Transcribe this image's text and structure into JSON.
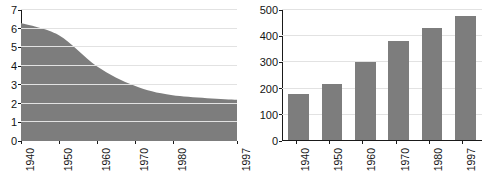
{
  "charts": {
    "left": {
      "title_line1": "NUMBER OF FARMS",
      "title_line2": "(IN MILLIONS)",
      "y_ticks": [
        "0",
        "1",
        "2",
        "3",
        "4",
        "5",
        "6",
        "7"
      ],
      "x_ticks": [
        "1940",
        "1950",
        "1960",
        "1970",
        "1980",
        "1997"
      ]
    },
    "right": {
      "title_line1": "SIZE OF AVERAGE FARM",
      "title_line2": "(IN ACRES)",
      "y_ticks": [
        "0",
        "100",
        "200",
        "300",
        "400",
        "500"
      ],
      "x_ticks": [
        "1940",
        "1950",
        "1960",
        "1970",
        "1980",
        "1997"
      ]
    }
  },
  "chart_data": [
    {
      "type": "area",
      "title": "NUMBER OF FARMS (IN MILLIONS)",
      "xlabel": "",
      "ylabel": "",
      "ylim": [
        0,
        7
      ],
      "ytick_values": [
        0,
        1,
        2,
        3,
        4,
        5,
        6,
        7
      ],
      "grid": true,
      "legend": "none",
      "fill_color": "#7d7d7d",
      "x": [
        1940,
        1950,
        1960,
        1970,
        1980,
        1997
      ],
      "categories": [
        "1940",
        "1950",
        "1960",
        "1970",
        "1980",
        "1997"
      ],
      "values": [
        6.3,
        5.65,
        4.0,
        2.95,
        2.45,
        2.2
      ],
      "series": [
        {
          "name": "Number of farms (millions)",
          "values": [
            6.3,
            5.65,
            4.0,
            2.95,
            2.45,
            2.2
          ]
        }
      ]
    },
    {
      "type": "bar",
      "title": "SIZE OF AVERAGE FARM (IN ACRES)",
      "xlabel": "",
      "ylabel": "",
      "ylim": [
        0,
        500
      ],
      "ytick_values": [
        0,
        100,
        200,
        300,
        400,
        500
      ],
      "grid": true,
      "legend": "none",
      "bar_color": "#7d7d7d",
      "categories": [
        "1940",
        "1950",
        "1960",
        "1970",
        "1980",
        "1997"
      ],
      "values": [
        175,
        213,
        298,
        377,
        428,
        475
      ],
      "series": [
        {
          "name": "Size of average farm (acres)",
          "values": [
            175,
            213,
            298,
            377,
            428,
            475
          ]
        }
      ]
    }
  ]
}
